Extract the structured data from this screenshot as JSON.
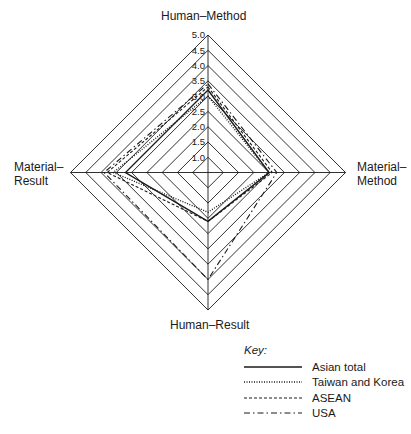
{
  "chart_data": {
    "type": "radar",
    "title": "",
    "axes": [
      "Human–Method",
      "Material–Method",
      "Human–Result",
      "Material–Result"
    ],
    "axis_positions": [
      "top",
      "right",
      "bottom",
      "left"
    ],
    "scale": {
      "min_ring": 1.0,
      "max_ring": 5.0,
      "step": 0.5,
      "tick_labels": [
        "1.0",
        "1.5",
        "2.0",
        "2.5",
        "3.0",
        "3.5",
        "4.0",
        "4.5",
        "5.0"
      ]
    },
    "series": [
      {
        "name": "Asian total",
        "line_style": "solid",
        "values": [
          3.2,
          2.5,
          2.1,
          3.2
        ]
      },
      {
        "name": "Taiwan and  Korea",
        "line_style": "dotted",
        "values": [
          3.0,
          2.5,
          1.8,
          3.6
        ]
      },
      {
        "name": "ASEAN",
        "line_style": "dashed",
        "values": [
          3.3,
          2.6,
          2.1,
          3.8
        ]
      },
      {
        "name": "USA",
        "line_style": "dash-dot",
        "values": [
          3.4,
          2.75,
          4.0,
          3.9
        ]
      }
    ],
    "legend": {
      "title": "Key:",
      "position": "bottom-right"
    },
    "grid": true
  },
  "labels": {
    "top": "Human–Method",
    "right_line1": "Material–",
    "right_line2": "Method",
    "bottom": "Human–Result",
    "left_line1": "Material–",
    "left_line2": "Result"
  },
  "legend": {
    "title": "Key:",
    "items": [
      "Asian total",
      "Taiwan and  Korea",
      "ASEAN",
      "USA"
    ]
  },
  "colors": {
    "ink": "#1a1a1a",
    "background": "#ffffff"
  }
}
